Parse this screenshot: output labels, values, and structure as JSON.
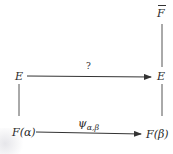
{
  "diagram": {
    "type": "commutative-diagram",
    "nodes": {
      "fbar": {
        "label": "F",
        "overline": true
      },
      "e_left": {
        "label": "E"
      },
      "e_right": {
        "label": "E"
      },
      "f_alpha": {
        "label": "F(α)"
      },
      "f_beta": {
        "label": "F(β)"
      }
    },
    "edges": {
      "top": {
        "from": "E",
        "to": "E",
        "label": "?",
        "arrow": true
      },
      "bottom": {
        "from": "F(α)",
        "to": "F(β)",
        "label_main": "ψ",
        "label_sub": "α,β",
        "arrow": true
      },
      "left": {
        "from": "E",
        "to": "F(α)",
        "arrow": false
      },
      "right_lower": {
        "from": "E",
        "to": "F(β)",
        "arrow": false
      },
      "right_upper": {
        "from": "F̄",
        "to": "E",
        "arrow": false
      }
    },
    "line_color": "#444444"
  }
}
